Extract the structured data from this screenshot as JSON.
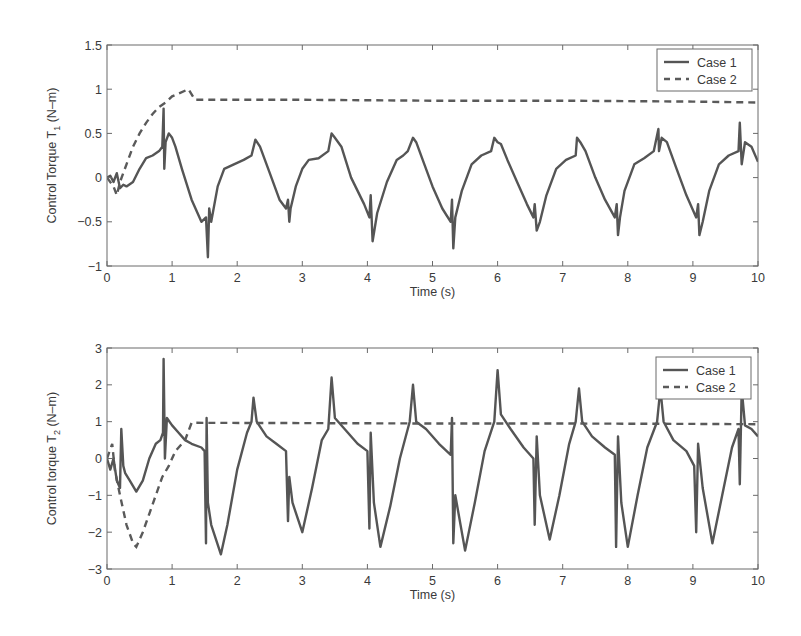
{
  "figure": {
    "panels": [
      {
        "id": "top",
        "ylabel_main": "Control Torque T",
        "ylabel_sub": "1",
        "ylabel_unit": " (N–m)",
        "xlabel": "Time (s)",
        "yticks": [
          "1.5",
          "1",
          "0.5",
          "0",
          "−0.5",
          "−1"
        ],
        "xticks": [
          "0",
          "1",
          "2",
          "3",
          "4",
          "5",
          "6",
          "7",
          "8",
          "9",
          "10"
        ],
        "legend": [
          "Case 1",
          "Case 2"
        ]
      },
      {
        "id": "bottom",
        "ylabel_main": "Control torque T",
        "ylabel_sub": "2",
        "ylabel_unit": " (N–m)",
        "xlabel": "Time (s)",
        "yticks": [
          "3",
          "2",
          "1",
          "0",
          "−1",
          "−2",
          "−3"
        ],
        "xticks": [
          "0",
          "1",
          "2",
          "3",
          "4",
          "5",
          "6",
          "7",
          "8",
          "9",
          "10"
        ],
        "legend": [
          "Case 1",
          "Case 2"
        ]
      }
    ]
  },
  "chart_data": [
    {
      "type": "line",
      "title": "",
      "xlabel": "Time (s)",
      "ylabel": "Control Torque T1 (N-m)",
      "xlim": [
        0,
        10
      ],
      "ylim": [
        -1,
        1.5
      ],
      "yticks": [
        1.5,
        1,
        0.5,
        0,
        -0.5,
        -1
      ],
      "xticks": [
        0,
        1,
        2,
        3,
        4,
        5,
        6,
        7,
        8,
        9,
        10
      ],
      "grid": false,
      "legend_position": "upper right",
      "series": [
        {
          "name": "Case 1",
          "style": "solid",
          "x": [
            0,
            0.05,
            0.1,
            0.15,
            0.2,
            0.25,
            0.3,
            0.4,
            0.5,
            0.6,
            0.7,
            0.8,
            0.85,
            0.87,
            0.88,
            0.9,
            0.95,
            1.0,
            1.05,
            1.15,
            1.3,
            1.45,
            1.52,
            1.55,
            1.57,
            1.6,
            1.7,
            1.8,
            1.95,
            2.1,
            2.22,
            2.28,
            2.35,
            2.5,
            2.65,
            2.75,
            2.78,
            2.8,
            2.82,
            2.9,
            3.0,
            3.1,
            3.25,
            3.4,
            3.45,
            3.5,
            3.6,
            3.75,
            3.95,
            4.03,
            4.05,
            4.08,
            4.15,
            4.3,
            4.45,
            4.55,
            4.62,
            4.7,
            4.75,
            4.85,
            5.0,
            5.15,
            5.28,
            5.3,
            5.32,
            5.35,
            5.45,
            5.6,
            5.75,
            5.9,
            5.95,
            6.0,
            6.05,
            6.15,
            6.3,
            6.45,
            6.55,
            6.57,
            6.6,
            6.65,
            6.75,
            6.9,
            7.05,
            7.2,
            7.22,
            7.27,
            7.35,
            7.5,
            7.65,
            7.8,
            7.83,
            7.85,
            7.88,
            7.95,
            8.1,
            8.25,
            8.4,
            8.47,
            8.48,
            8.52,
            8.6,
            8.75,
            8.9,
            9.05,
            9.08,
            9.1,
            9.15,
            9.25,
            9.4,
            9.55,
            9.7,
            9.72,
            9.75,
            9.8,
            9.9,
            10.0
          ],
          "y": [
            0,
            0.02,
            -0.05,
            0.05,
            -0.12,
            -0.08,
            -0.1,
            -0.05,
            0.1,
            0.22,
            0.25,
            0.3,
            0.35,
            0.78,
            0.1,
            0.4,
            0.5,
            0.45,
            0.35,
            0.1,
            -0.25,
            -0.5,
            -0.45,
            -0.9,
            -0.35,
            -0.5,
            -0.1,
            0.1,
            0.15,
            0.2,
            0.25,
            0.43,
            0.35,
            0.05,
            -0.25,
            -0.35,
            -0.25,
            -0.5,
            -0.35,
            -0.1,
            0.1,
            0.2,
            0.22,
            0.3,
            0.5,
            0.45,
            0.35,
            0.0,
            -0.3,
            -0.45,
            -0.2,
            -0.72,
            -0.4,
            -0.05,
            0.2,
            0.25,
            0.3,
            0.45,
            0.4,
            0.2,
            -0.1,
            -0.35,
            -0.5,
            -0.25,
            -0.8,
            -0.45,
            -0.15,
            0.15,
            0.25,
            0.3,
            0.45,
            0.4,
            0.38,
            0.2,
            -0.05,
            -0.3,
            -0.45,
            -0.3,
            -0.6,
            -0.5,
            -0.2,
            0.1,
            0.2,
            0.25,
            0.45,
            0.4,
            0.3,
            0.0,
            -0.25,
            -0.45,
            -0.3,
            -0.65,
            -0.45,
            -0.15,
            0.15,
            0.22,
            0.3,
            0.55,
            0.3,
            0.45,
            0.4,
            0.1,
            -0.2,
            -0.45,
            -0.3,
            -0.65,
            -0.5,
            -0.15,
            0.15,
            0.25,
            0.3,
            0.62,
            0.15,
            0.4,
            0.35,
            0.18
          ]
        },
        {
          "name": "Case 2",
          "style": "dashed",
          "x": [
            0,
            0.1,
            0.15,
            0.2,
            0.3,
            0.4,
            0.5,
            0.6,
            0.7,
            0.8,
            0.9,
            1.0,
            1.1,
            1.25,
            1.35,
            3,
            5,
            7,
            9,
            10
          ],
          "y": [
            0,
            -0.1,
            -0.2,
            -0.05,
            0.15,
            0.35,
            0.5,
            0.62,
            0.72,
            0.8,
            0.85,
            0.92,
            0.95,
            1.0,
            0.88,
            0.88,
            0.87,
            0.87,
            0.86,
            0.85
          ]
        }
      ]
    },
    {
      "type": "line",
      "title": "",
      "xlabel": "Time (s)",
      "ylabel": "Control torque T2 (N-m)",
      "xlim": [
        0,
        10
      ],
      "ylim": [
        -3,
        3
      ],
      "yticks": [
        3,
        2,
        1,
        0,
        -1,
        -2,
        -3
      ],
      "xticks": [
        0,
        1,
        2,
        3,
        4,
        5,
        6,
        7,
        8,
        9,
        10
      ],
      "grid": false,
      "legend_position": "upper right",
      "series": [
        {
          "name": "Case 1",
          "style": "solid",
          "x": [
            0,
            0.05,
            0.1,
            0.15,
            0.2,
            0.22,
            0.25,
            0.28,
            0.35,
            0.45,
            0.55,
            0.65,
            0.75,
            0.82,
            0.86,
            0.87,
            0.89,
            0.92,
            1.0,
            1.1,
            1.2,
            1.3,
            1.45,
            1.5,
            1.52,
            1.53,
            1.55,
            1.6,
            1.75,
            1.85,
            2.0,
            2.15,
            2.22,
            2.25,
            2.3,
            2.45,
            2.6,
            2.75,
            2.78,
            2.8,
            2.85,
            3.0,
            3.15,
            3.3,
            3.4,
            3.45,
            3.5,
            3.65,
            3.85,
            4.0,
            4.03,
            4.05,
            4.1,
            4.2,
            4.35,
            4.5,
            4.65,
            4.7,
            4.75,
            4.9,
            5.1,
            5.28,
            5.3,
            5.32,
            5.35,
            5.5,
            5.65,
            5.8,
            5.95,
            6.0,
            6.05,
            6.2,
            6.4,
            6.55,
            6.57,
            6.6,
            6.65,
            6.8,
            6.95,
            7.1,
            7.2,
            7.25,
            7.3,
            7.45,
            7.65,
            7.8,
            7.82,
            7.85,
            7.9,
            8.0,
            8.15,
            8.3,
            8.45,
            8.5,
            8.55,
            8.7,
            8.9,
            9.02,
            9.05,
            9.08,
            9.15,
            9.3,
            9.45,
            9.6,
            9.7,
            9.72,
            9.75,
            9.8,
            9.9,
            10.0
          ],
          "y": [
            0,
            -0.3,
            0,
            -0.6,
            -0.8,
            0.8,
            -0.2,
            -0.4,
            -0.6,
            -0.9,
            -0.6,
            0.0,
            0.4,
            0.5,
            0.7,
            2.7,
            0.0,
            1.1,
            0.9,
            0.7,
            0.5,
            0.4,
            0.3,
            0.2,
            -2.3,
            1.1,
            -1.2,
            -1.8,
            -2.6,
            -1.8,
            -0.3,
            0.7,
            1.0,
            1.65,
            1.0,
            0.6,
            0.4,
            0.2,
            -1.7,
            -0.5,
            -1.2,
            -2.0,
            -0.8,
            0.5,
            0.8,
            2.2,
            1.1,
            0.8,
            0.4,
            0.2,
            -1.9,
            0.7,
            -1.2,
            -2.4,
            -1.3,
            0.0,
            1.0,
            2.0,
            1.0,
            0.8,
            0.4,
            0.1,
            1.1,
            -2.3,
            -1.0,
            -2.5,
            -1.2,
            0.2,
            1.0,
            2.4,
            1.2,
            0.8,
            0.3,
            0.0,
            -1.8,
            0.6,
            -1.0,
            -2.2,
            -1.0,
            0.4,
            1.0,
            1.9,
            1.0,
            0.6,
            0.3,
            0.1,
            -2.4,
            0.6,
            -1.2,
            -2.4,
            -1.0,
            0.3,
            1.0,
            1.9,
            1.0,
            0.5,
            0.2,
            -0.2,
            -2.0,
            0.4,
            -0.8,
            -2.3,
            -1.0,
            0.3,
            0.8,
            -0.7,
            1.9,
            0.9,
            0.8,
            0.6
          ]
        },
        {
          "name": "Case 2",
          "style": "dashed",
          "x": [
            0,
            0.08,
            0.12,
            0.2,
            0.3,
            0.4,
            0.45,
            0.55,
            0.65,
            0.75,
            0.85,
            0.95,
            1.05,
            1.2,
            1.3,
            3,
            5,
            7,
            9,
            10
          ],
          "y": [
            0,
            0.4,
            -0.3,
            -1.0,
            -1.8,
            -2.3,
            -2.4,
            -2.0,
            -1.5,
            -1.0,
            -0.5,
            -0.2,
            0.2,
            0.5,
            0.97,
            0.96,
            0.95,
            0.95,
            0.94,
            0.93
          ]
        }
      ]
    }
  ]
}
